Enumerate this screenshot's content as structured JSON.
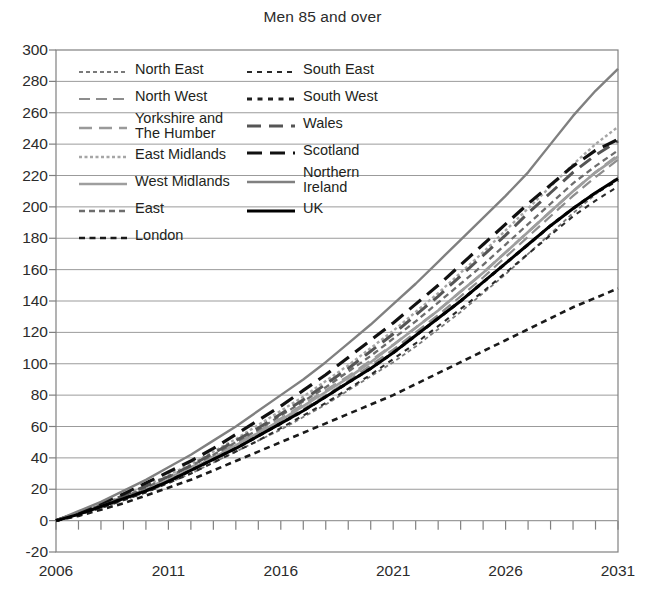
{
  "chart_data": {
    "type": "line",
    "title": "Men 85 and over",
    "xlabel": "",
    "ylabel": "",
    "xlim": [
      2006,
      2031
    ],
    "ylim": [
      -20,
      300
    ],
    "ytick_step": 20,
    "xtick_step": 1,
    "xlabel_step": 5,
    "grid": true,
    "legend_position": "upper-left-inside",
    "x": [
      2006,
      2007,
      2008,
      2009,
      2010,
      2011,
      2012,
      2013,
      2014,
      2015,
      2016,
      2017,
      2018,
      2019,
      2020,
      2021,
      2022,
      2023,
      2024,
      2025,
      2026,
      2027,
      2028,
      2029,
      2030,
      2031
    ],
    "yticks": [
      -20,
      0,
      20,
      40,
      60,
      80,
      100,
      120,
      140,
      160,
      180,
      200,
      220,
      240,
      260,
      280,
      300
    ],
    "xticks": [
      2006,
      2007,
      2008,
      2009,
      2010,
      2011,
      2012,
      2013,
      2014,
      2015,
      2016,
      2017,
      2018,
      2019,
      2020,
      2021,
      2022,
      2023,
      2024,
      2025,
      2026,
      2027,
      2028,
      2029,
      2030,
      2031
    ],
    "xtick_labels": [
      "2006",
      "2011",
      "2016",
      "2021",
      "2026",
      "2031"
    ],
    "xtick_label_values": [
      2006,
      2011,
      2016,
      2021,
      2026,
      2031
    ],
    "series": [
      {
        "name": "North East",
        "color": "#7a7a7a",
        "width": 1.8,
        "dash": "4,3",
        "values": [
          0,
          4,
          8,
          13,
          18,
          24,
          30,
          37,
          44,
          51,
          58,
          66,
          74,
          83,
          92,
          101,
          111,
          122,
          133,
          145,
          157,
          170,
          183,
          196,
          208,
          219
        ]
      },
      {
        "name": "North West",
        "color": "#8d8d8d",
        "width": 2.2,
        "dash": "11,6",
        "values": [
          0,
          4,
          9,
          14,
          20,
          26,
          33,
          40,
          47,
          55,
          63,
          71,
          80,
          89,
          99,
          109,
          120,
          131,
          143,
          155,
          168,
          181,
          194,
          207,
          219,
          230
        ]
      },
      {
        "name": "Yorkshire and\nThe Humber",
        "color": "#9a9a9a",
        "width": 2.6,
        "dash": "13,7",
        "values": [
          0,
          4,
          9,
          14,
          20,
          27,
          34,
          41,
          49,
          57,
          65,
          74,
          83,
          92,
          102,
          112,
          123,
          134,
          146,
          158,
          171,
          184,
          197,
          210,
          222,
          233
        ]
      },
      {
        "name": "East Midlands",
        "color": "#a6a6a6",
        "width": 2.4,
        "dash": "3,2.5",
        "values": [
          0,
          5,
          10,
          16,
          22,
          29,
          36,
          44,
          52,
          61,
          70,
          79,
          89,
          99,
          110,
          121,
          133,
          145,
          158,
          171,
          185,
          199,
          213,
          227,
          240,
          251
        ]
      },
      {
        "name": "West Midlands",
        "color": "#9e9e9e",
        "width": 2.6,
        "dash": "",
        "values": [
          0,
          4,
          9,
          14,
          20,
          26,
          33,
          40,
          48,
          56,
          64,
          73,
          82,
          91,
          101,
          112,
          123,
          134,
          146,
          158,
          171,
          184,
          197,
          210,
          222,
          232
        ]
      },
      {
        "name": "East",
        "color": "#6d6d6d",
        "width": 2.3,
        "dash": "6,4",
        "values": [
          0,
          5,
          10,
          15,
          21,
          28,
          35,
          42,
          50,
          58,
          67,
          76,
          85,
          95,
          105,
          116,
          127,
          139,
          151,
          163,
          176,
          189,
          202,
          215,
          226,
          236
        ]
      },
      {
        "name": "London",
        "color": "#1a1a1a",
        "width": 2.6,
        "dash": "6,4.5",
        "values": [
          0,
          3,
          7,
          11,
          16,
          21,
          26,
          32,
          38,
          44,
          50,
          56,
          62,
          68,
          74,
          80,
          87,
          94,
          101,
          108,
          115,
          122,
          129,
          136,
          142,
          148
        ]
      },
      {
        "name": "South East",
        "color": "#2b2b2b",
        "width": 2.1,
        "dash": "5,5",
        "values": [
          0,
          4,
          8,
          13,
          18,
          24,
          30,
          37,
          44,
          51,
          59,
          67,
          75,
          84,
          93,
          103,
          113,
          124,
          135,
          146,
          158,
          170,
          182,
          194,
          204,
          213
        ]
      },
      {
        "name": "South West",
        "color": "#1f1f1f",
        "width": 3.0,
        "dash": "5,5.5",
        "values": [
          0,
          4,
          9,
          14,
          19,
          25,
          32,
          39,
          46,
          54,
          62,
          70,
          79,
          88,
          97,
          107,
          118,
          129,
          140,
          152,
          164,
          176,
          188,
          199,
          209,
          217
        ]
      },
      {
        "name": "Wales",
        "color": "#555555",
        "width": 3.0,
        "dash": "14,8",
        "values": [
          0,
          5,
          10,
          16,
          22,
          28,
          35,
          43,
          51,
          59,
          68,
          77,
          87,
          97,
          108,
          119,
          131,
          143,
          156,
          169,
          182,
          196,
          209,
          222,
          233,
          242
        ]
      },
      {
        "name": "Scotland",
        "color": "#111111",
        "width": 3.2,
        "dash": "15,8",
        "values": [
          0,
          5,
          11,
          17,
          24,
          31,
          38,
          46,
          55,
          64,
          73,
          83,
          93,
          104,
          115,
          126,
          138,
          150,
          163,
          176,
          189,
          202,
          214,
          226,
          236,
          243
        ]
      },
      {
        "name": "Northern\nIreland",
        "color": "#808080",
        "width": 2.4,
        "dash": "",
        "values": [
          0,
          6,
          12,
          19,
          26,
          34,
          42,
          51,
          60,
          70,
          80,
          90,
          101,
          113,
          125,
          138,
          151,
          165,
          179,
          193,
          207,
          222,
          240,
          258,
          274,
          288
        ]
      },
      {
        "name": "UK",
        "color": "#000000",
        "width": 3.0,
        "dash": "",
        "values": [
          0,
          4,
          9,
          14,
          19,
          25,
          32,
          39,
          46,
          54,
          62,
          70,
          79,
          88,
          97,
          107,
          118,
          129,
          140,
          152,
          164,
          176,
          188,
          199,
          209,
          218
        ]
      }
    ],
    "legend": {
      "columns": [
        [
          "North East",
          "North West",
          "Yorkshire and\nThe Humber",
          "East Midlands",
          "West Midlands",
          "East",
          "London"
        ],
        [
          "South East",
          "South West",
          "Wales",
          "Scotland",
          "Northern\nIreland",
          "UK"
        ]
      ]
    },
    "colors": {
      "axis": "#808080",
      "grid": "#9b9b9b",
      "text": "#2b2b2b",
      "background": "#ffffff"
    }
  }
}
